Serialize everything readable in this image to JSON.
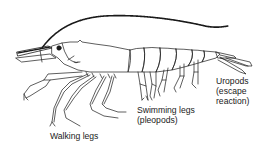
{
  "diagram": {
    "line_color": "#1a1a1a",
    "background": "#ffffff",
    "labels": {
      "walking_legs": {
        "line1": "Walking legs"
      },
      "swimming_legs": {
        "line1": "Swimming legs",
        "line2": "(pleopods)"
      },
      "uropods": {
        "line1": "Uropods",
        "line2": "(escape",
        "line3": "reaction)"
      }
    }
  }
}
